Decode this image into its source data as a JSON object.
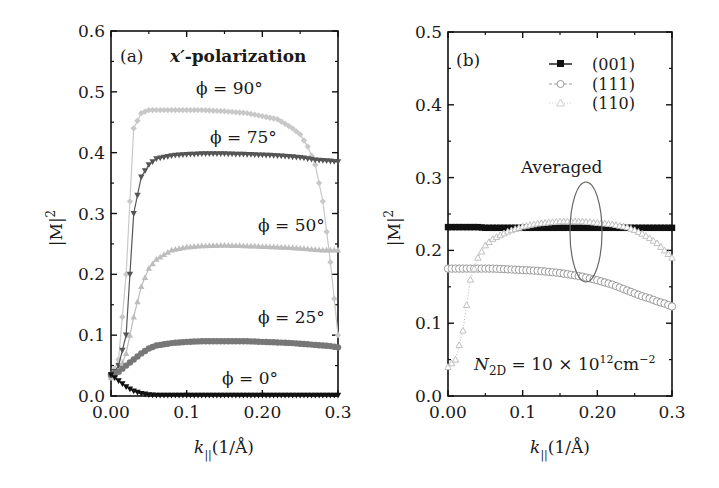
{
  "chart_data": [
    {
      "type": "line",
      "panel_label": "(a)",
      "title": "x′-polarization",
      "xlabel": "k∥(1/Å)",
      "ylabel": "|M|²",
      "xlim": [
        0,
        0.3
      ],
      "ylim": [
        0,
        0.6
      ],
      "xticks": [
        "0.00",
        "0.1",
        "0.20",
        "0.3"
      ],
      "yticks": [
        "0.0",
        "0.1",
        "0.2",
        "0.3",
        "0.4",
        "0.5",
        "0.6"
      ],
      "grid": false,
      "x": [
        0.0,
        0.01,
        0.02,
        0.03,
        0.04,
        0.05,
        0.06,
        0.08,
        0.1,
        0.12,
        0.15,
        0.18,
        0.2,
        0.22,
        0.24,
        0.25,
        0.26,
        0.27,
        0.28,
        0.29,
        0.3
      ],
      "series": [
        {
          "name": "φ = 90°",
          "label": "φ = 90°",
          "marker": "diamond",
          "color": "#c8c8c8",
          "values": [
            0.03,
            0.06,
            0.2,
            0.44,
            0.465,
            0.47,
            0.47,
            0.47,
            0.47,
            0.47,
            0.468,
            0.465,
            0.46,
            0.455,
            0.44,
            0.43,
            0.41,
            0.38,
            0.32,
            0.22,
            0.1
          ]
        },
        {
          "name": "φ = 75°",
          "label": "φ = 75°",
          "marker": "triangle-down",
          "color": "#555555",
          "values": [
            0.03,
            0.05,
            0.1,
            0.3,
            0.36,
            0.38,
            0.39,
            0.395,
            0.397,
            0.398,
            0.398,
            0.397,
            0.396,
            0.395,
            0.393,
            0.392,
            0.39,
            0.388,
            0.387,
            0.386,
            0.385
          ]
        },
        {
          "name": "φ = 50°",
          "label": "φ = 50°",
          "marker": "triangle-up",
          "color": "#bdbdbd",
          "values": [
            0.03,
            0.04,
            0.07,
            0.13,
            0.18,
            0.21,
            0.225,
            0.24,
            0.245,
            0.247,
            0.248,
            0.247,
            0.246,
            0.245,
            0.244,
            0.243,
            0.242,
            0.241,
            0.24,
            0.24,
            0.24
          ]
        },
        {
          "name": "φ = 25°",
          "label": "φ = 25°",
          "marker": "circle",
          "color": "#777777",
          "values": [
            0.035,
            0.04,
            0.05,
            0.06,
            0.07,
            0.078,
            0.083,
            0.087,
            0.089,
            0.09,
            0.09,
            0.09,
            0.089,
            0.088,
            0.087,
            0.086,
            0.085,
            0.084,
            0.083,
            0.082,
            0.08
          ]
        },
        {
          "name": "φ = 0°",
          "label": "φ = 0°",
          "marker": "triangle-down",
          "color": "#111111",
          "values": [
            0.035,
            0.025,
            0.015,
            0.008,
            0.004,
            0.002,
            0.001,
            0.001,
            0.001,
            0.001,
            0.001,
            0.001,
            0.001,
            0.001,
            0.001,
            0.001,
            0.001,
            0.001,
            0.001,
            0.001,
            0.001
          ]
        }
      ]
    },
    {
      "type": "line",
      "panel_label": "(b)",
      "title": "",
      "xlabel": "k∥(1/Å)",
      "ylabel": "|M|²",
      "xlim": [
        0,
        0.3
      ],
      "ylim": [
        0,
        0.5
      ],
      "xticks": [
        "0.00",
        "0.1",
        "0.20",
        "0.3"
      ],
      "yticks": [
        "0.0",
        "0.1",
        "0.2",
        "0.3",
        "0.4",
        "0.5"
      ],
      "grid": false,
      "legend_position": "upper right",
      "annotations": [
        "Averaged",
        "N2D = 10 × 10¹² cm⁻²"
      ],
      "x": [
        0.0,
        0.01,
        0.02,
        0.03,
        0.04,
        0.05,
        0.06,
        0.08,
        0.1,
        0.12,
        0.15,
        0.18,
        0.2,
        0.22,
        0.24,
        0.25,
        0.26,
        0.27,
        0.28,
        0.29,
        0.3
      ],
      "series": [
        {
          "name": "(001)",
          "marker": "square",
          "line": "solid",
          "color": "#111111",
          "values": [
            0.232,
            0.232,
            0.232,
            0.232,
            0.232,
            0.231,
            0.231,
            0.231,
            0.231,
            0.231,
            0.231,
            0.231,
            0.231,
            0.231,
            0.231,
            0.231,
            0.231,
            0.231,
            0.231,
            0.231,
            0.231
          ]
        },
        {
          "name": "(111)",
          "marker": "circle-open",
          "line": "dashed",
          "color": "#9a9a9a",
          "values": [
            0.175,
            0.175,
            0.175,
            0.175,
            0.175,
            0.175,
            0.175,
            0.174,
            0.173,
            0.172,
            0.169,
            0.164,
            0.159,
            0.153,
            0.145,
            0.141,
            0.137,
            0.134,
            0.13,
            0.127,
            0.123
          ]
        },
        {
          "name": "(110)",
          "marker": "triangle-open",
          "line": "dotted",
          "color": "#c0c0c0",
          "values": [
            0.04,
            0.05,
            0.09,
            0.16,
            0.19,
            0.207,
            0.216,
            0.226,
            0.233,
            0.237,
            0.24,
            0.24,
            0.238,
            0.236,
            0.232,
            0.228,
            0.223,
            0.217,
            0.21,
            0.2,
            0.19
          ]
        }
      ]
    }
  ],
  "panel_a": {
    "label": "(a)",
    "title_var": "x′",
    "title_rest": "-polarization",
    "ylabel": "|M|",
    "ylabel_sup": "2",
    "xlabel_var": "k",
    "xlabel_sub": "||",
    "xlabel_rest": "(1/Å)",
    "curve_labels": [
      "ϕ = 90°",
      "ϕ = 75°",
      "ϕ = 50°",
      "ϕ = 25°",
      "ϕ = 0°"
    ]
  },
  "panel_b": {
    "label": "(b)",
    "ylabel": "|M|",
    "ylabel_sup": "2",
    "xlabel_var": "k",
    "xlabel_sub": "||",
    "xlabel_rest": "(1/Å)",
    "legend": [
      "(001)",
      "(111)",
      "(110)"
    ],
    "averaged_label": "Averaged",
    "density_var": "N",
    "density_sub": "2D",
    "density_mid": " = 10 × 10",
    "density_exp": "12",
    "density_unit": "cm",
    "density_unit_exp": "−2"
  }
}
